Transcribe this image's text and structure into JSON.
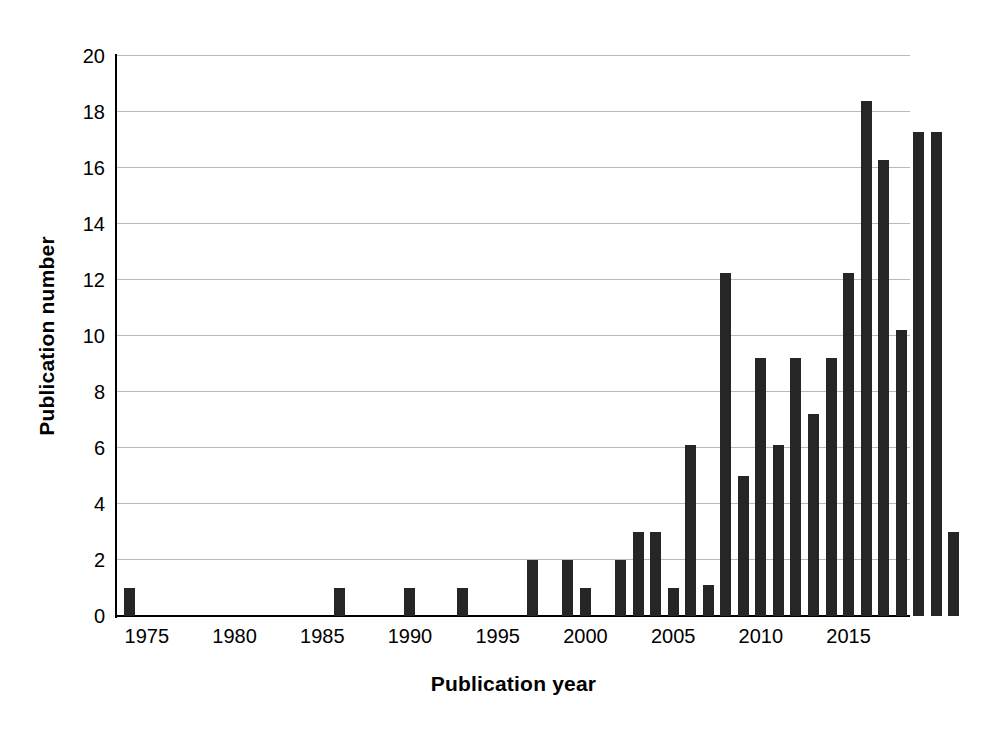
{
  "chart_data": {
    "type": "bar",
    "title": "",
    "xlabel": "Publication year",
    "ylabel": "Publication number",
    "xlim": [
      1973.3,
      2018.5
    ],
    "ylim": [
      0,
      20
    ],
    "ytick_values": [
      0,
      2,
      4,
      6,
      8,
      10,
      12,
      14,
      16,
      18,
      20
    ],
    "ytick_labels": [
      "0",
      "2",
      "4",
      "6",
      "8",
      "10",
      "12",
      "14",
      "16",
      "18",
      "20"
    ],
    "xtick_values": [
      1975,
      1980,
      1985,
      1990,
      1995,
      2000,
      2005,
      2010,
      2015
    ],
    "xtick_labels": [
      "1975",
      "1980",
      "1985",
      "1990",
      "1995",
      "2000",
      "2005",
      "2010",
      "2015"
    ],
    "grid": "horizontal",
    "legend": "none",
    "bar_color": "#262626",
    "gridline_color": "#b9b9b9",
    "axis_color": "#000000",
    "categories": [
      1974,
      1986,
      1990,
      1993,
      1997,
      1999,
      2000,
      2002,
      2003,
      2004,
      2005,
      2006,
      2007,
      2008,
      2009,
      2010,
      2011,
      2012,
      2013,
      2014,
      2015,
      2016,
      2017,
      2018
    ],
    "values": [
      1,
      1,
      1,
      1,
      2,
      2,
      1,
      2,
      3,
      3,
      1,
      6.1,
      1.1,
      12.25,
      5,
      9.2,
      6.1,
      9.2,
      7.2,
      9.2,
      12.25,
      18.4,
      16.3,
      10.2
    ],
    "bars": [
      {
        "x": 1974,
        "y": 1
      },
      {
        "x": 1986,
        "y": 1
      },
      {
        "x": 1990,
        "y": 1
      },
      {
        "x": 1993,
        "y": 1
      },
      {
        "x": 1997,
        "y": 2
      },
      {
        "x": 1999,
        "y": 2
      },
      {
        "x": 2000,
        "y": 1
      },
      {
        "x": 2002,
        "y": 2
      },
      {
        "x": 2003,
        "y": 3
      },
      {
        "x": 2004,
        "y": 3
      },
      {
        "x": 2005,
        "y": 1
      },
      {
        "x": 2006,
        "y": 6.1
      },
      {
        "x": 2007,
        "y": 1.1
      },
      {
        "x": 2008,
        "y": 12.25
      },
      {
        "x": 2009,
        "y": 5
      },
      {
        "x": 2010,
        "y": 9.2
      },
      {
        "x": 2011,
        "y": 6.1
      },
      {
        "x": 2012,
        "y": 9.2
      },
      {
        "x": 2013,
        "y": 7.2
      },
      {
        "x": 2014,
        "y": 9.2
      },
      {
        "x": 2015,
        "y": 12.25
      },
      {
        "x": 2016,
        "y": 18.4
      },
      {
        "x": 2017,
        "y": 16.3
      },
      {
        "x": 2018,
        "y": 10.2
      },
      {
        "x": 2019,
        "y": 17.3
      },
      {
        "x": 2020,
        "y": 17.3
      },
      {
        "x": 2021,
        "y": 3
      }
    ]
  }
}
